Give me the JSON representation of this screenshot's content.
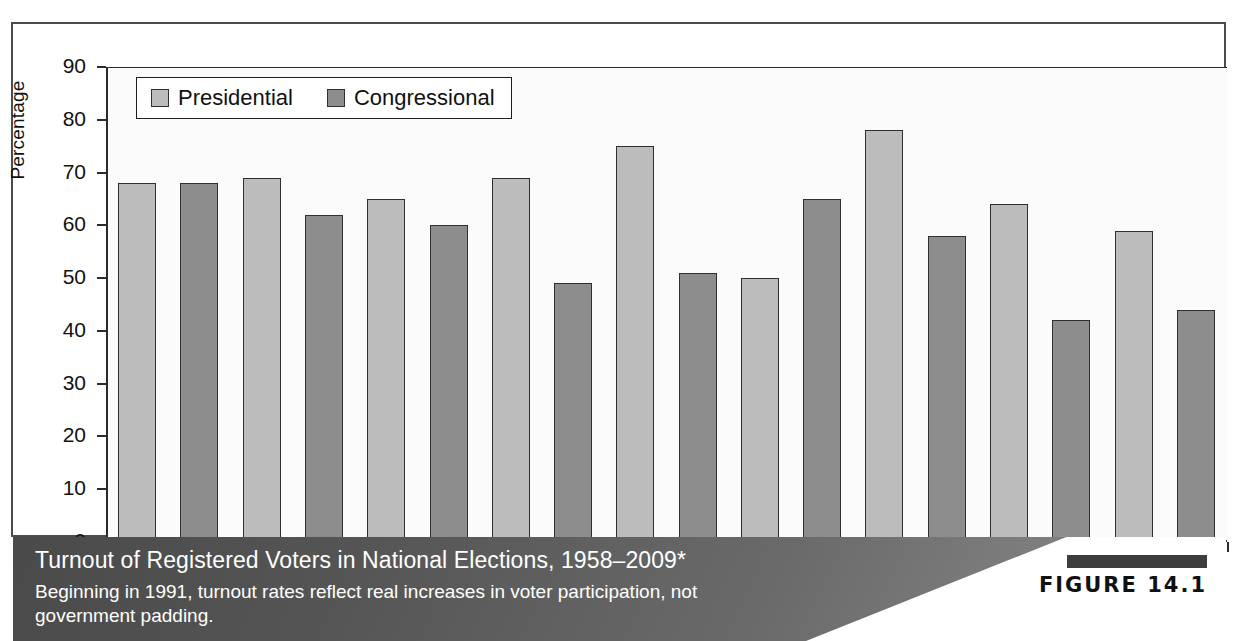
{
  "chart_data": {
    "type": "bar",
    "title": "Turnout of Registered Voters in National Elections, 1958–2009*",
    "xlabel": "",
    "ylabel": "Percentage",
    "ylim": [
      0,
      90
    ],
    "ytick_step": 10,
    "yticks": [
      "90",
      "80",
      "70",
      "60",
      "50",
      "40",
      "30",
      "20",
      "10",
      "0"
    ],
    "grid": false,
    "legend_position": "top-left-inside",
    "legend": [
      "Presidential",
      "Congressional"
    ],
    "categories": [
      "1958",
      "1961",
      "1964",
      "1967",
      "1970",
      "1973",
      "1976",
      "1979",
      "1982",
      "1985",
      "1988",
      "1991",
      "1994",
      "1997",
      "2000",
      "2004",
      "2006",
      "2009"
    ],
    "values": [
      68,
      68,
      69,
      62,
      65,
      60,
      69,
      49,
      75,
      51,
      50,
      65,
      78,
      58,
      64,
      42,
      59,
      44
    ],
    "series_of_bar": [
      "Presidential",
      "Congressional",
      "Presidential",
      "Congressional",
      "Presidential",
      "Congressional",
      "Presidential",
      "Congressional",
      "Presidential",
      "Congressional",
      "Presidential",
      "Congressional",
      "Presidential",
      "Congressional",
      "Presidential",
      "Congressional",
      "Presidential",
      "Congressional"
    ],
    "bars": [
      {
        "year": "1958",
        "value": 68,
        "series": "Presidential"
      },
      {
        "year": "1961",
        "value": 68,
        "series": "Congressional"
      },
      {
        "year": "1964",
        "value": 69,
        "series": "Presidential"
      },
      {
        "year": "1967",
        "value": 62,
        "series": "Congressional"
      },
      {
        "year": "1970",
        "value": 65,
        "series": "Presidential"
      },
      {
        "year": "1973",
        "value": 60,
        "series": "Congressional"
      },
      {
        "year": "1976",
        "value": 69,
        "series": "Presidential"
      },
      {
        "year": "1979",
        "value": 49,
        "series": "Congressional"
      },
      {
        "year": "1982",
        "value": 75,
        "series": "Presidential"
      },
      {
        "year": "1985",
        "value": 51,
        "series": "Congressional"
      },
      {
        "year": "1988",
        "value": 50,
        "series": "Presidential"
      },
      {
        "year": "1991",
        "value": 65,
        "series": "Congressional"
      },
      {
        "year": "1994",
        "value": 78,
        "series": "Presidential"
      },
      {
        "year": "1997",
        "value": 58,
        "series": "Congressional"
      },
      {
        "year": "2000",
        "value": 64,
        "series": "Presidential"
      },
      {
        "year": "2004",
        "value": 42,
        "series": "Congressional"
      },
      {
        "year": "2006",
        "value": 59,
        "series": "Presidential"
      },
      {
        "year": "2009",
        "value": 44,
        "series": "Congressional"
      }
    ],
    "colors": {
      "presidential": "#bcbcbc",
      "congressional": "#8d8d8d",
      "bar_outline": "#2f2f2f",
      "axis": "#2b2b2b",
      "plot_background": "#fbfbfb"
    }
  },
  "legend": {
    "items": [
      {
        "label": "Presidential",
        "swatch": "presidential"
      },
      {
        "label": "Congressional",
        "swatch": "congressional"
      }
    ]
  },
  "caption": {
    "title": "Turnout of Registered Voters in National Elections, 1958–2009*",
    "subtitle": "Beginning in 1991, turnout rates reflect real increases in voter participation, not government padding.",
    "figure_label": "FIGURE 14.1",
    "band_color": "#555555",
    "text_color": "#ffffff"
  }
}
